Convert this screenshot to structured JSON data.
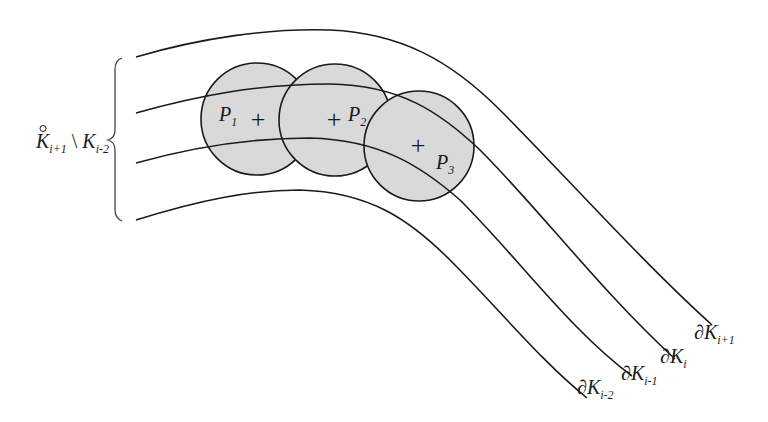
{
  "figure": {
    "type": "schematic",
    "colors": {
      "stroke": "#1a1a1a",
      "disk_fill": "#d9d9d9",
      "background": "#ffffff"
    }
  },
  "boundaries": [
    {
      "name": "boundary-k-i-plus-1",
      "symbol": "∂K",
      "sub": "i+1"
    },
    {
      "name": "boundary-k-i",
      "symbol": "∂K",
      "sub": "i"
    },
    {
      "name": "boundary-k-i-minus-1",
      "symbol": "∂K",
      "sub": "i-1"
    },
    {
      "name": "boundary-k-i-minus-2",
      "symbol": "∂K",
      "sub": "i-2"
    }
  ],
  "disks": [
    {
      "label": "P",
      "sub": "1"
    },
    {
      "label": "P",
      "sub": "2"
    },
    {
      "label": "P",
      "sub": "3"
    }
  ],
  "center_mark": "+",
  "brace_label": {
    "left_symbol": "K",
    "left_sub": "i+1",
    "operator": "\\",
    "right_symbol": "K",
    "right_sub": "i-2"
  }
}
